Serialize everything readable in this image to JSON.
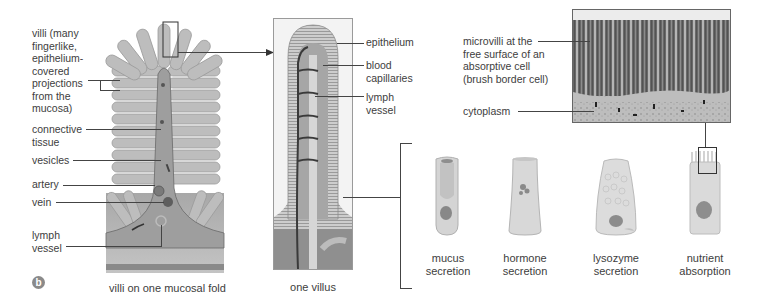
{
  "figure": {
    "panel_badge": "b",
    "colors": {
      "tissue_gray": "#9a9a9a",
      "villus_fill": "#c9c9c9",
      "line_dark": "#444444",
      "text": "#3d3d3d"
    }
  },
  "fold_panel": {
    "caption": "villi on one mucosal fold",
    "labels": {
      "villi": "villi (many\nfingerlike,\nepithelium-\ncovered\nprojections\nfrom the\nmucosa)",
      "connective_tissue": "connective\ntissue",
      "vesicles": "vesicles",
      "artery": "artery",
      "vein": "vein",
      "lymph_vessel": "lymph\nvessel"
    }
  },
  "villus_panel": {
    "caption": "one villus",
    "labels": {
      "epithelium": "epithelium",
      "blood_capillaries": "blood\ncapillaries",
      "lymph_vessel": "lymph\nvessel"
    }
  },
  "micrograph_panel": {
    "labels": {
      "microvilli": "microvilli at the\nfree surface of an\nabsorptive cell\n(brush border cell)",
      "cytoplasm": "cytoplasm"
    }
  },
  "cell_types": [
    {
      "caption": "mucus\nsecretion"
    },
    {
      "caption": "hormone\nsecretion"
    },
    {
      "caption": "lysozyme\nsecretion"
    },
    {
      "caption": "nutrient\nabsorption"
    }
  ]
}
